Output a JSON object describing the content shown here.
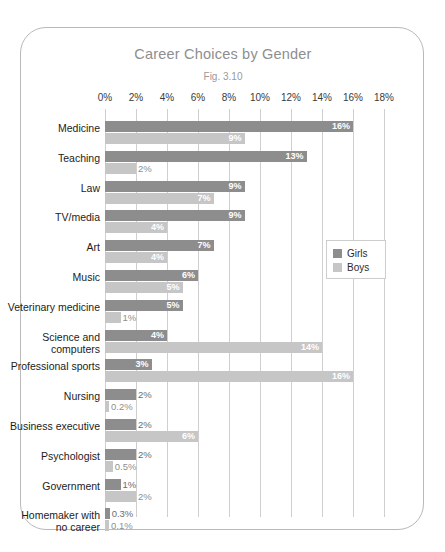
{
  "chart_data": {
    "type": "bar",
    "orientation": "horizontal",
    "title": "Career Choices by Gender",
    "subtitle": "Fig. 3.10",
    "xlabel": "",
    "ylabel": "",
    "xlim": [
      0,
      18
    ],
    "xtick_labels": [
      "0%",
      "2%",
      "4%",
      "6%",
      "8%",
      "10%",
      "12%",
      "14%",
      "16%",
      "18%"
    ],
    "xtick_values": [
      0,
      2,
      4,
      6,
      8,
      10,
      12,
      14,
      16,
      18
    ],
    "grid": true,
    "legend_position": "inside-right",
    "categories": [
      "Medicine",
      "Teaching",
      "Law",
      "TV/media",
      "Art",
      "Music",
      "Veterinary medicine",
      "Science and computers",
      "Professional sports",
      "Nursing",
      "Business executive",
      "Psychologist",
      "Government",
      "Homemaker with no career"
    ],
    "series": [
      {
        "name": "Girls",
        "color": "#8d8d8d",
        "values": [
          16,
          13,
          9,
          9,
          7,
          6,
          5,
          4,
          3,
          2,
          2,
          2,
          1,
          0.3
        ],
        "labels": [
          "16%",
          "13%",
          "9%",
          "9%",
          "7%",
          "6%",
          "5%",
          "4%",
          "3%",
          "2%",
          "2%",
          "2%",
          "1%",
          "0.3%"
        ]
      },
      {
        "name": "Boys",
        "color": "#c6c6c6",
        "values": [
          9,
          2,
          7,
          4,
          4,
          5,
          1,
          14,
          16,
          0.2,
          6,
          0.5,
          2,
          0.1
        ],
        "labels": [
          "9%",
          "2%",
          "7%",
          "4%",
          "4%",
          "5%",
          "1%",
          "14%",
          "16%",
          "0.2%",
          "6%",
          "0.5%",
          "2%",
          "0.1%"
        ]
      }
    ]
  },
  "legend": {
    "items": [
      {
        "label": "Girls"
      },
      {
        "label": "Boys"
      }
    ]
  }
}
